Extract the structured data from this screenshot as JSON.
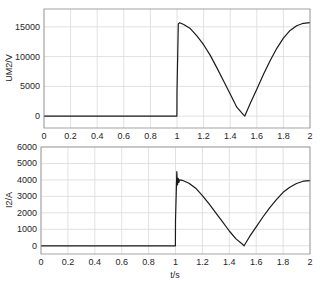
{
  "chart_data": [
    {
      "type": "line",
      "title": "",
      "xlabel": "",
      "ylabel": "UM2/V",
      "xlim": [
        0,
        2
      ],
      "ylim": [
        -2000,
        18000
      ],
      "xticks": [
        "0",
        "0.2",
        "0.4",
        "0.6",
        "0.8",
        "1",
        "1.2",
        "1.4",
        "1.6",
        "1.8",
        "2"
      ],
      "yticks": [
        "0",
        "5000",
        "10000",
        "15000"
      ],
      "grid": true,
      "series": [
        {
          "name": "UM2",
          "x": [
            0,
            0.999,
            1.0,
            1.01,
            1.02,
            1.05,
            1.1,
            1.15,
            1.2,
            1.25,
            1.3,
            1.35,
            1.4,
            1.45,
            1.5,
            1.51,
            1.55,
            1.6,
            1.65,
            1.7,
            1.75,
            1.8,
            1.85,
            1.9,
            1.95,
            2.0
          ],
          "values": [
            0,
            0,
            4000,
            15500,
            15700,
            15400,
            14700,
            13500,
            12000,
            10200,
            8100,
            5900,
            3700,
            1500,
            200,
            0,
            2100,
            4500,
            7000,
            9300,
            11400,
            13100,
            14400,
            15200,
            15600,
            15700
          ]
        }
      ]
    },
    {
      "type": "line",
      "title": "",
      "xlabel": "t/s",
      "ylabel": "I2/A",
      "xlim": [
        0,
        2
      ],
      "ylim": [
        -500,
        6000
      ],
      "xticks": [
        "0",
        "0.2",
        "0.4",
        "0.6",
        "0.8",
        "1",
        "1.2",
        "1.4",
        "1.6",
        "1.8",
        "2"
      ],
      "yticks": [
        "0",
        "1000",
        "2000",
        "3000",
        "4000",
        "5000",
        "6000"
      ],
      "grid": true,
      "series": [
        {
          "name": "I2",
          "x": [
            0,
            0.999,
            1.0,
            1.01,
            1.015,
            1.02,
            1.025,
            1.03,
            1.05,
            1.1,
            1.15,
            1.2,
            1.25,
            1.3,
            1.35,
            1.4,
            1.45,
            1.5,
            1.51,
            1.55,
            1.6,
            1.65,
            1.7,
            1.75,
            1.8,
            1.85,
            1.9,
            1.95,
            2.0
          ],
          "values": [
            0,
            0,
            1500,
            4500,
            3700,
            4100,
            3850,
            4000,
            3980,
            3800,
            3500,
            3050,
            2550,
            2000,
            1450,
            900,
            420,
            80,
            0,
            550,
            1150,
            1750,
            2300,
            2800,
            3250,
            3550,
            3780,
            3920,
            3950
          ]
        }
      ]
    }
  ],
  "labels": {
    "top_ylabel": "UM2/V",
    "bottom_ylabel": "I2/A",
    "bottom_xlabel": "t/s"
  },
  "colors": {
    "line": "#1a1a1a",
    "grid": "#d9d9d9",
    "axis": "#262626"
  }
}
